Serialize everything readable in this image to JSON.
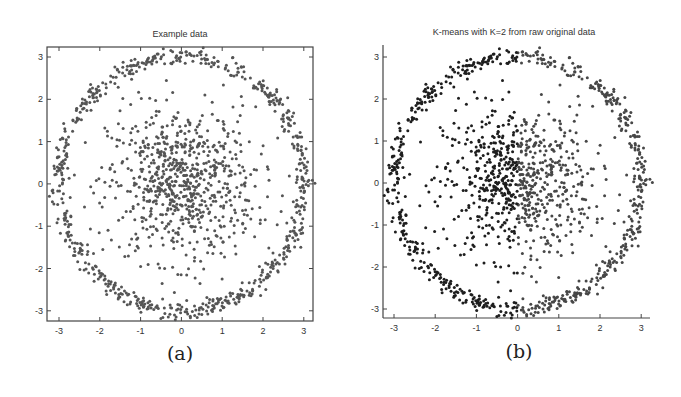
{
  "panels": [
    {
      "caption": "(a)",
      "title": "Example data"
    },
    {
      "caption": "(b)",
      "title": "K-means with K=2 from raw original data"
    }
  ],
  "colors": {
    "panel_a_points": "#555555",
    "panel_b_cluster_left": "#1e1e1e",
    "panel_b_cluster_right": "#474747",
    "axes": "#444444"
  },
  "chart_data": [
    {
      "type": "scatter",
      "title": "Example data",
      "caption": "(a)",
      "xlabel": "",
      "ylabel": "",
      "xlim": [
        -3.3,
        3.2
      ],
      "ylim": [
        -3.2,
        3.2
      ],
      "xticks": [
        -3,
        -2,
        -1,
        0,
        1,
        2,
        3
      ],
      "yticks": [
        -3,
        -2,
        -1,
        0,
        1,
        2,
        3
      ],
      "grid": false,
      "frame": "box",
      "series": [
        {
          "name": "outer ring",
          "shape": "ring",
          "radius": 3.0,
          "radial_noise": 0.1,
          "n_points": 700
        },
        {
          "name": "inner cluster",
          "shape": "gaussian",
          "center": [
            0,
            0
          ],
          "std": 0.9,
          "n_points": 750
        }
      ]
    },
    {
      "type": "scatter",
      "title": "K-means with K=2 from raw original data",
      "caption": "(b)",
      "xlabel": "",
      "ylabel": "",
      "xlim": [
        -3.3,
        3.2
      ],
      "ylim": [
        -3.2,
        3.2
      ],
      "xticks": [
        -3,
        -2,
        -1,
        0,
        1,
        2,
        3
      ],
      "yticks": [
        -3,
        -2,
        -1,
        0,
        1,
        2,
        3
      ],
      "grid": false,
      "frame": "left-bottom",
      "series": [
        {
          "name": "cluster 1 (x < 0)",
          "rule": "x<0"
        },
        {
          "name": "cluster 2 (x >= 0)",
          "rule": "x>=0"
        }
      ],
      "note": "Same data as (a), partitioned by K-means into left/right halves"
    }
  ]
}
